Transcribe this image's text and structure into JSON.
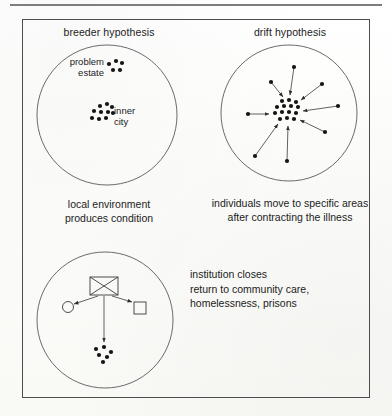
{
  "figure": {
    "panels": {
      "breeder": {
        "title": "breeder hypothesis",
        "caption": "local environment\nproduces condition",
        "labels": {
          "problem_estate": "problem\nestate",
          "inner_city": "inner\ncity"
        },
        "clusters": {
          "problem_estate_dots": [
            {
              "x": 109,
              "y": 64
            },
            {
              "x": 116,
              "y": 61
            },
            {
              "x": 122,
              "y": 63
            },
            {
              "x": 113,
              "y": 70
            },
            {
              "x": 120,
              "y": 70
            }
          ],
          "inner_city_dots": [
            {
              "x": 100,
              "y": 106
            },
            {
              "x": 107,
              "y": 104
            },
            {
              "x": 112,
              "y": 107
            },
            {
              "x": 94,
              "y": 111
            },
            {
              "x": 101,
              "y": 112
            },
            {
              "x": 108,
              "y": 112
            },
            {
              "x": 92,
              "y": 118
            },
            {
              "x": 99,
              "y": 119
            },
            {
              "x": 106,
              "y": 118
            },
            {
              "x": 113,
              "y": 113
            }
          ]
        },
        "circle": {
          "cx": 107,
          "cy": 115,
          "r": 70
        }
      },
      "drift": {
        "title": "drift hypothesis",
        "caption": "individuals move to specific areas\nafter contracting the illness",
        "circle": {
          "cx": 289,
          "cy": 113,
          "r": 68
        },
        "center_dots": [
          {
            "x": 282,
            "y": 101
          },
          {
            "x": 289,
            "y": 100
          },
          {
            "x": 296,
            "y": 102
          },
          {
            "x": 277,
            "y": 107
          },
          {
            "x": 284,
            "y": 106
          },
          {
            "x": 291,
            "y": 106
          },
          {
            "x": 298,
            "y": 107
          },
          {
            "x": 275,
            "y": 113
          },
          {
            "x": 282,
            "y": 112
          },
          {
            "x": 289,
            "y": 112
          },
          {
            "x": 296,
            "y": 113
          },
          {
            "x": 280,
            "y": 119
          },
          {
            "x": 287,
            "y": 118
          },
          {
            "x": 294,
            "y": 119
          }
        ],
        "migrants": [
          {
            "x": 294,
            "y": 67,
            "to_x": 290,
            "to_y": 95
          },
          {
            "x": 271,
            "y": 82,
            "to_x": 283,
            "to_y": 97
          },
          {
            "x": 322,
            "y": 84,
            "to_x": 301,
            "to_y": 100
          },
          {
            "x": 338,
            "y": 106,
            "to_x": 303,
            "to_y": 111
          },
          {
            "x": 248,
            "y": 114,
            "to_x": 269,
            "to_y": 114
          },
          {
            "x": 325,
            "y": 132,
            "to_x": 300,
            "to_y": 120
          },
          {
            "x": 255,
            "y": 156,
            "to_x": 278,
            "to_y": 124
          },
          {
            "x": 287,
            "y": 161,
            "to_x": 288,
            "to_y": 126
          }
        ]
      },
      "institution": {
        "text": "institution closes\nreturn to community care,\nhomelessness, prisons",
        "circle": {
          "cx": 105,
          "cy": 320,
          "r": 68
        },
        "closed_box": {
          "x": 90,
          "y": 277,
          "w": 28,
          "h": 18
        },
        "targets": [
          {
            "shape": "circle",
            "cx": 68,
            "cy": 307,
            "r": 5.5
          },
          {
            "shape": "square",
            "x": 134,
            "y": 302,
            "w": 12,
            "h": 12
          },
          {
            "shape": "dot-cluster"
          }
        ],
        "dispersal_dots": [
          {
            "x": 96,
            "y": 349
          },
          {
            "x": 104,
            "y": 347
          },
          {
            "x": 111,
            "y": 352
          },
          {
            "x": 99,
            "y": 355
          },
          {
            "x": 107,
            "y": 357
          },
          {
            "x": 103,
            "y": 362
          }
        ],
        "arrows": [
          {
            "from_x": 98,
            "from_y": 296,
            "to_x": 74,
            "to_y": 304
          },
          {
            "from_x": 112,
            "from_y": 296,
            "to_x": 132,
            "to_y": 302
          },
          {
            "from_x": 104,
            "from_y": 296,
            "to_x": 104,
            "to_y": 342
          }
        ]
      }
    }
  }
}
